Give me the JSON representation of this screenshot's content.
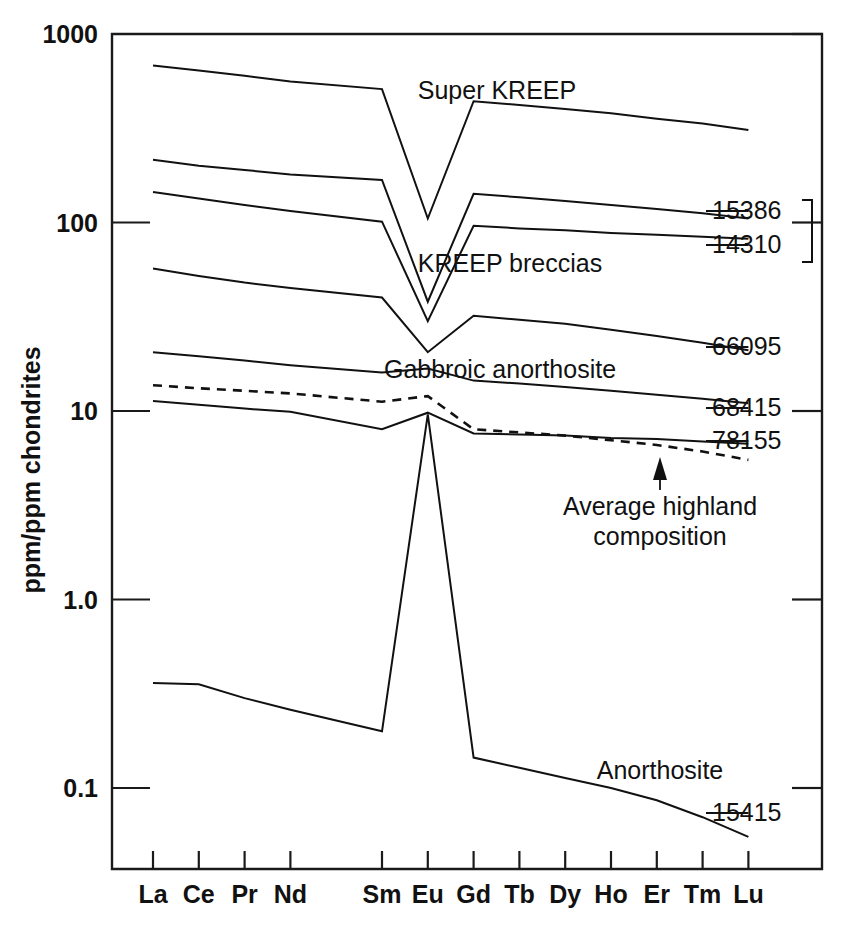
{
  "chart_data": {
    "type": "line",
    "title": "",
    "xlabel": "",
    "ylabel": "ppm/ppm chondrites",
    "yscale": "log",
    "ylim": [
      0.04,
      1000
    ],
    "ytick_labels": [
      "1000",
      "100",
      "10",
      "1.0",
      "0.1"
    ],
    "ytick_values": [
      1000,
      100,
      10,
      1.0,
      0.1
    ],
    "grid": false,
    "legend": "inline-annotations",
    "categories": [
      "La",
      "Ce",
      "Pr",
      "Nd",
      "Sm",
      "Eu",
      "Gd",
      "Tb",
      "Dy",
      "Ho",
      "Er",
      "Tm",
      "Lu"
    ],
    "x_tick_labels": [
      "La",
      "Ce",
      "Pr",
      "Nd",
      "Sm",
      "Eu",
      "Gd",
      "Tb",
      "Dy",
      "Ho",
      "Er",
      "Tm",
      "Lu"
    ],
    "x_axis_note": "Rare earth element series; Pm position skipped leaving a gap between Nd and Sm",
    "series": [
      {
        "name": "Super KREEP",
        "style": "solid",
        "label_text": "Super KREEP",
        "end_label": "",
        "values": [
          680,
          640,
          600,
          560,
          510,
          105,
          440,
          420,
          400,
          380,
          355,
          335,
          310
        ]
      },
      {
        "name": "15386",
        "style": "solid",
        "label_text": "KREEP breccias",
        "end_label": "15386",
        "values": [
          215,
          200,
          190,
          180,
          168,
          38,
          142,
          136,
          130,
          124,
          118,
          112,
          105
        ]
      },
      {
        "name": "14310",
        "style": "solid",
        "label_text": "",
        "end_label": "14310",
        "values": [
          145,
          134,
          124,
          115,
          101,
          30,
          96,
          93,
          91,
          88,
          86,
          84,
          82
        ]
      },
      {
        "name": "66095",
        "style": "solid",
        "label_text": "",
        "end_label": "66095",
        "values": [
          57,
          52,
          48,
          45,
          40,
          20.5,
          32,
          30.5,
          29,
          27,
          25,
          23,
          21
        ]
      },
      {
        "name": "68415",
        "style": "solid",
        "label_text": "Gabbroic anorthosite",
        "end_label": "68415",
        "values": [
          20.5,
          19.5,
          18.5,
          17.5,
          16.0,
          16.8,
          14.5,
          14.0,
          13.4,
          12.8,
          12.2,
          11.6,
          11.0
        ]
      },
      {
        "name": "Average highland composition",
        "style": "dashed",
        "label_text": "Average highland composition",
        "end_label": "",
        "values": [
          13.7,
          13.2,
          12.8,
          12.4,
          11.2,
          12.0,
          8.0,
          7.7,
          7.4,
          7.0,
          6.6,
          6.1,
          5.5
        ]
      },
      {
        "name": "78155",
        "style": "solid",
        "label_text": "",
        "end_label": "78155",
        "values": [
          11.3,
          10.8,
          10.3,
          9.9,
          8.0,
          9.8,
          7.6,
          7.5,
          7.4,
          7.2,
          7.1,
          6.9,
          6.7
        ]
      },
      {
        "name": "15415",
        "style": "solid",
        "label_text": "Anorthosite",
        "end_label": "15415",
        "values": [
          0.36,
          0.355,
          0.3,
          0.26,
          0.2,
          9.6,
          0.145,
          0.128,
          0.113,
          0.1,
          0.086,
          0.07,
          0.055
        ]
      }
    ],
    "annotations": [
      {
        "id": "super-kreep",
        "text": "Super KREEP"
      },
      {
        "id": "kreep-breccias",
        "text": "KREEP breccias"
      },
      {
        "id": "gabbroic-anorthosite",
        "text": "Gabbroic anorthosite"
      },
      {
        "id": "anorthosite",
        "text": "Anorthosite"
      },
      {
        "id": "average-highland-1",
        "text": "Average highland"
      },
      {
        "id": "average-highland-2",
        "text": "composition"
      }
    ],
    "sample_labels": [
      "15386",
      "14310",
      "66095",
      "68415",
      "78155",
      "15415"
    ],
    "colors": {
      "line": "#111111",
      "axis": "#1a1a1a",
      "background": "#ffffff"
    }
  },
  "axis": {
    "y_title": "ppm/ppm chondrites",
    "y_ticks": [
      "1000",
      "100",
      "10",
      "1.0",
      "0.1"
    ],
    "x_ticks": [
      "La",
      "Ce",
      "Pr",
      "Nd",
      "Sm",
      "Eu",
      "Gd",
      "Tb",
      "Dy",
      "Ho",
      "Er",
      "Tm",
      "Lu"
    ]
  },
  "labels": {
    "super_kreep": "Super KREEP",
    "kreep_breccias": "KREEP breccias",
    "gabbroic_anorthosite": "Gabbroic anorthosite",
    "anorthosite": "Anorthosite",
    "avg_highland_line1": "Average highland",
    "avg_highland_line2": "composition",
    "s15386": "15386",
    "s14310": "14310",
    "s66095": "66095",
    "s68415": "68415",
    "s78155": "78155",
    "s15415": "15415"
  }
}
